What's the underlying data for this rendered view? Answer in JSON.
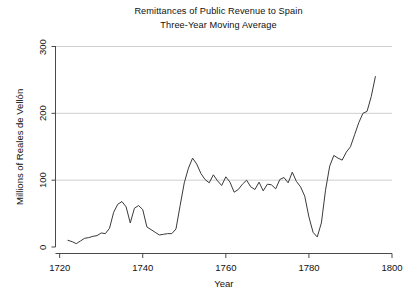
{
  "chart_data": {
    "type": "line",
    "title": "Remittances of Public Revenue to Spain",
    "subtitle": "Three-Year Moving Average",
    "xlabel": "Year",
    "ylabel": "Millions of Reales de Vellón",
    "xlim": [
      1719,
      1800
    ],
    "ylim": [
      0,
      300
    ],
    "xticks": [
      1720,
      1740,
      1760,
      1780,
      1800
    ],
    "xtick_labels": [
      "1720",
      "1740",
      "1760",
      "1780",
      "1800"
    ],
    "yticks": [
      0,
      100,
      200,
      300
    ],
    "ytick_labels": [
      "0",
      "100",
      "200",
      "300"
    ],
    "grid": "horizontal",
    "legend": "none",
    "line_color": "#3a3a3a",
    "x": [
      1722,
      1723,
      1724,
      1725,
      1726,
      1727,
      1728,
      1729,
      1730,
      1731,
      1732,
      1733,
      1734,
      1735,
      1736,
      1737,
      1738,
      1739,
      1740,
      1741,
      1742,
      1743,
      1744,
      1745,
      1746,
      1747,
      1748,
      1749,
      1750,
      1751,
      1752,
      1753,
      1754,
      1755,
      1756,
      1757,
      1758,
      1759,
      1760,
      1761,
      1762,
      1763,
      1764,
      1765,
      1766,
      1767,
      1768,
      1769,
      1770,
      1771,
      1772,
      1773,
      1774,
      1775,
      1776,
      1777,
      1778,
      1779,
      1780,
      1781,
      1782,
      1783,
      1784,
      1785,
      1786,
      1787,
      1788,
      1789,
      1790,
      1791,
      1792,
      1793,
      1794,
      1795,
      1796
    ],
    "values": [
      10,
      8,
      5,
      9,
      13,
      14,
      16,
      17,
      21,
      20,
      28,
      52,
      64,
      68,
      60,
      36,
      58,
      62,
      56,
      30,
      26,
      22,
      18,
      19,
      20,
      20,
      27,
      62,
      96,
      118,
      133,
      124,
      110,
      101,
      96,
      108,
      99,
      92,
      105,
      97,
      82,
      86,
      94,
      100,
      90,
      86,
      97,
      84,
      94,
      93,
      87,
      101,
      104,
      96,
      112,
      98,
      90,
      76,
      45,
      22,
      15,
      36,
      85,
      121,
      137,
      133,
      130,
      142,
      150,
      168,
      186,
      200,
      203,
      225,
      255
    ],
    "annotations": []
  },
  "axis": {
    "x_tick_labels": [
      "1720",
      "1740",
      "1760",
      "1780",
      "1800"
    ],
    "y_tick_labels": [
      "0",
      "100",
      "200",
      "300"
    ],
    "x_title": "Year",
    "y_title": "Millions of Reales de Vellón"
  },
  "titles": {
    "main": "Remittances of Public Revenue to Spain",
    "sub": "Three-Year Moving Average"
  }
}
